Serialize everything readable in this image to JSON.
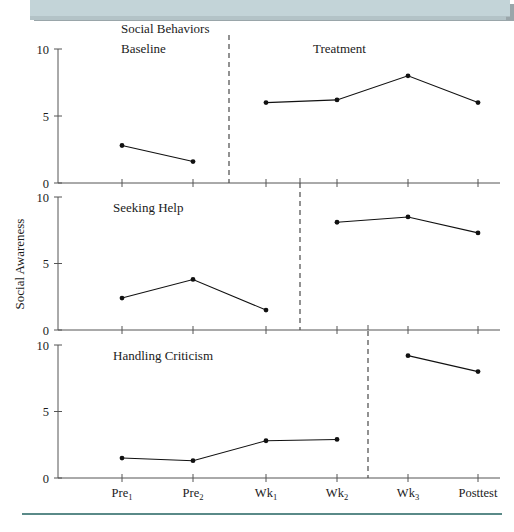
{
  "figure": {
    "y_axis_label": "Social Awareness",
    "phase_labels": {
      "baseline": "Baseline",
      "treatment": "Treatment"
    },
    "x_tick_labels": [
      {
        "base": "Pre",
        "sub": "1",
        "full": "Pre1"
      },
      {
        "base": "Pre",
        "sub": "2",
        "full": "Pre2"
      },
      {
        "base": "Wk",
        "sub": "1",
        "full": "Wk1"
      },
      {
        "base": "Wk",
        "sub": "2",
        "full": "Wk2"
      },
      {
        "base": "Wk",
        "sub": "3",
        "full": "Wk3"
      },
      {
        "base": "Posttest",
        "sub": "",
        "full": "Posttest"
      }
    ],
    "y_tick_labels": [
      "0",
      "5",
      "10"
    ],
    "panel_titles": [
      "Social Behaviors",
      "Seeking Help",
      "Handling Criticism"
    ],
    "colors": {
      "banner": "#c3d4d8",
      "rule": "#5a8a88",
      "line": "#111111",
      "axis": "#555555"
    }
  },
  "chart_data": {
    "type": "line",
    "title": "Social Behaviors",
    "xlabel": "",
    "ylabel": "Social Awareness",
    "ylim": [
      0,
      10
    ],
    "yticks": [
      0,
      5,
      10
    ],
    "x": [
      "Pre1",
      "Pre2",
      "Wk1",
      "Wk2",
      "Wk3",
      "Posttest"
    ],
    "grid": false,
    "legend": "none",
    "layout": "3 stacked multiple-baseline panels sharing one x axis",
    "panels": [
      {
        "name": "Social Behaviors",
        "phase_annotations": [
          "Baseline",
          "Treatment"
        ],
        "intervention_after": "Pre2",
        "segments": [
          {
            "phase": "Baseline",
            "x": [
              "Pre1",
              "Pre2"
            ],
            "values": [
              2.8,
              1.6
            ]
          },
          {
            "phase": "Treatment",
            "x": [
              "Wk1",
              "Wk2",
              "Wk3",
              "Posttest"
            ],
            "values": [
              6.0,
              6.2,
              8.0,
              6.0
            ]
          }
        ]
      },
      {
        "name": "Seeking Help",
        "phase_annotations": [],
        "intervention_after": "Wk1",
        "segments": [
          {
            "phase": "Baseline",
            "x": [
              "Pre1",
              "Pre2",
              "Wk1"
            ],
            "values": [
              2.4,
              3.8,
              1.5
            ]
          },
          {
            "phase": "Treatment",
            "x": [
              "Wk2",
              "Wk3",
              "Posttest"
            ],
            "values": [
              8.1,
              8.5,
              7.3
            ]
          }
        ]
      },
      {
        "name": "Handling Criticism",
        "phase_annotations": [],
        "intervention_after": "Wk2",
        "segments": [
          {
            "phase": "Baseline",
            "x": [
              "Pre1",
              "Pre2",
              "Wk1",
              "Wk2"
            ],
            "values": [
              1.5,
              1.3,
              2.8,
              2.9
            ]
          },
          {
            "phase": "Treatment",
            "x": [
              "Wk3",
              "Posttest"
            ],
            "values": [
              9.2,
              8.0
            ]
          }
        ]
      }
    ]
  }
}
